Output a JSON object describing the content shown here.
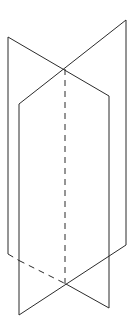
{
  "figure": {
    "line_color": "#2b2b2b",
    "background": "#ffffff",
    "planes": [
      {
        "name": "plane-a"
      },
      {
        "name": "plane-b"
      }
    ],
    "intersection_line": {
      "style": "dashed"
    },
    "hidden_edge": {
      "style": "dashed"
    }
  }
}
